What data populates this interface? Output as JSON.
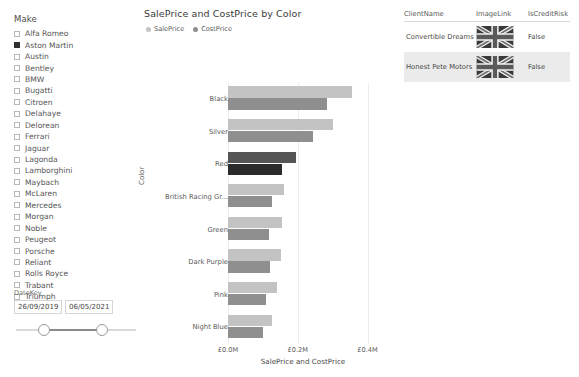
{
  "make_slicer": {
    "title": "Make",
    "items": [
      {
        "label": "Alfa Romeo",
        "checked": false
      },
      {
        "label": "Aston Martin",
        "checked": true
      },
      {
        "label": "Austin",
        "checked": false
      },
      {
        "label": "Bentley",
        "checked": false
      },
      {
        "label": "BMW",
        "checked": false
      },
      {
        "label": "Bugatti",
        "checked": false
      },
      {
        "label": "Citroen",
        "checked": false
      },
      {
        "label": "Delahaye",
        "checked": false
      },
      {
        "label": "Delorean",
        "checked": false
      },
      {
        "label": "Ferrari",
        "checked": false
      },
      {
        "label": "Jaguar",
        "checked": false
      },
      {
        "label": "Lagonda",
        "checked": false
      },
      {
        "label": "Lamborghini",
        "checked": false
      },
      {
        "label": "Maybach",
        "checked": false
      },
      {
        "label": "McLaren",
        "checked": false
      },
      {
        "label": "Mercedes",
        "checked": false
      },
      {
        "label": "Morgan",
        "checked": false
      },
      {
        "label": "Noble",
        "checked": false
      },
      {
        "label": "Peugeot",
        "checked": false
      },
      {
        "label": "Porsche",
        "checked": false
      },
      {
        "label": "Reliant",
        "checked": false
      },
      {
        "label": "Rolls Royce",
        "checked": false
      },
      {
        "label": "Trabant",
        "checked": false
      },
      {
        "label": "Triumph",
        "checked": false
      }
    ]
  },
  "date_slicer": {
    "title": "DateKey",
    "start_value": "26/09/2019",
    "end_value": "06/05/2021"
  },
  "chart_data": {
    "type": "bar",
    "orientation": "horizontal",
    "title": "SalePrice and CostPrice by Color",
    "xlabel": "SalePrice and CostPrice",
    "ylabel": "Color",
    "categories": [
      "Black",
      "Silver",
      "Red",
      "British Racing Gr...",
      "Green",
      "Dark Purple",
      "Pink",
      "Night Blue"
    ],
    "series": [
      {
        "name": "SalePrice",
        "color": "#c3c3c3",
        "values": [
          0.355,
          0.3,
          0.195,
          0.16,
          0.155,
          0.152,
          0.14,
          0.126
        ]
      },
      {
        "name": "CostPrice",
        "color": "#8f8f8f",
        "values": [
          0.285,
          0.245,
          0.155,
          0.125,
          0.118,
          0.12,
          0.11,
          0.1
        ]
      }
    ],
    "highlight": {
      "category": "Red",
      "sale_color": "#555555",
      "cost_color": "#2b2b2b"
    },
    "xlim": [
      0,
      0.43
    ],
    "xticks": [
      0,
      0.2,
      0.4
    ],
    "xtick_labels": [
      "£0.0M",
      "£0.2M",
      "£0.4M"
    ],
    "grid": true,
    "legend_position": "top-left",
    "units": "£ millions"
  },
  "client_table": {
    "columns": [
      "ClientName",
      "ImageLink",
      "IsCreditRisk"
    ],
    "rows": [
      {
        "client_name": "Convertible Dreams",
        "image_link": "uk-flag",
        "is_credit_risk": "False",
        "shaded": false
      },
      {
        "client_name": "Honest Pete Motors",
        "image_link": "uk-flag",
        "is_credit_risk": "False",
        "shaded": true
      }
    ]
  }
}
